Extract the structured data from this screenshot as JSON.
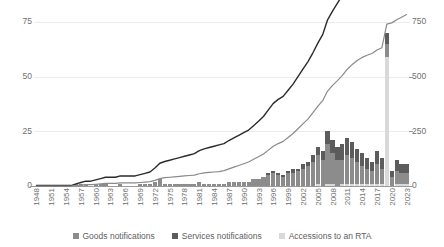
{
  "chart_data": {
    "type": "bar",
    "title": "",
    "subtitle": "",
    "xlabel": "",
    "ylabel": "",
    "y2label": "",
    "grid": true,
    "legend_position": "bottom",
    "ylim": [
      0,
      75
    ],
    "y2lim": [
      0,
      750
    ],
    "yticks": [
      "0",
      "25",
      "50",
      "75"
    ],
    "ytick_values": [
      0,
      25,
      50,
      75
    ],
    "y2ticks": [
      "0",
      "250",
      "500",
      "750"
    ],
    "y2tick_values": [
      0,
      250,
      500,
      750
    ],
    "x": [
      1948,
      1949,
      1950,
      1951,
      1952,
      1953,
      1954,
      1955,
      1956,
      1957,
      1958,
      1959,
      1960,
      1961,
      1962,
      1963,
      1964,
      1965,
      1966,
      1967,
      1968,
      1969,
      1970,
      1971,
      1972,
      1973,
      1974,
      1975,
      1976,
      1977,
      1978,
      1979,
      1980,
      1981,
      1982,
      1983,
      1984,
      1985,
      1986,
      1987,
      1988,
      1989,
      1990,
      1991,
      1992,
      1993,
      1994,
      1995,
      1996,
      1997,
      1998,
      1999,
      2000,
      2001,
      2002,
      2003,
      2004,
      2005,
      2006,
      2007,
      2008,
      2009,
      2010,
      2011,
      2012,
      2013,
      2014,
      2015,
      2016,
      2017,
      2018,
      2019,
      2020,
      2021,
      2022,
      2023
    ],
    "xtick_labels": [
      "1948",
      "1951",
      "1954",
      "1957",
      "1960",
      "1963",
      "1966",
      "1969",
      "1972",
      "1975",
      "1978",
      "1981",
      "1984",
      "1987",
      "1990",
      "1993",
      "1996",
      "1999",
      "2002",
      "2005",
      "2008",
      "2011",
      "2014",
      "2017",
      "2020",
      "2023"
    ],
    "xtick_values": [
      1948,
      1951,
      1954,
      1957,
      1960,
      1963,
      1966,
      1969,
      1972,
      1975,
      1978,
      1981,
      1984,
      1987,
      1990,
      1993,
      1996,
      1999,
      2002,
      2005,
      2008,
      2011,
      2014,
      2017,
      2020,
      2023
    ],
    "stacked": true,
    "series": [
      {
        "name": "Goods notifications",
        "kind": "bar",
        "axis": "left",
        "color": "#8c8c8c",
        "values": [
          0,
          0,
          0,
          0,
          0,
          0,
          0,
          0,
          1,
          1,
          1,
          0,
          1,
          1,
          1,
          0,
          0,
          1,
          0,
          0,
          0,
          1,
          1,
          1,
          2,
          3,
          1,
          1,
          1,
          1,
          1,
          1,
          1,
          2,
          1,
          1,
          1,
          1,
          1,
          2,
          2,
          2,
          2,
          2,
          3,
          3,
          4,
          5,
          6,
          5,
          4,
          6,
          6,
          7,
          8,
          9,
          11,
          13,
          12,
          18,
          14,
          12,
          11,
          13,
          12,
          10,
          8,
          7,
          6,
          9,
          7,
          6,
          4,
          6,
          5,
          5
        ]
      },
      {
        "name": "Services notifications",
        "kind": "bar",
        "axis": "left",
        "color": "#5c5c5c",
        "values": [
          0,
          0,
          0,
          0,
          0,
          0,
          0,
          0,
          0,
          0,
          0,
          0,
          0,
          0,
          0,
          0,
          0,
          0,
          0,
          0,
          0,
          0,
          0,
          0,
          0,
          0,
          0,
          0,
          0,
          0,
          0,
          0,
          0,
          0,
          0,
          0,
          0,
          0,
          0,
          0,
          0,
          0,
          0,
          0,
          0,
          0,
          0,
          1,
          1,
          1,
          1,
          1,
          2,
          1,
          2,
          2,
          3,
          4,
          4,
          6,
          6,
          6,
          7,
          8,
          7,
          6,
          6,
          5,
          4,
          6,
          5,
          5,
          3,
          5,
          4,
          4
        ]
      },
      {
        "name": "Accessions to an RTA",
        "kind": "bar",
        "axis": "left",
        "color": "#d9d9d9",
        "values": [
          0,
          0,
          0,
          0,
          0,
          0,
          0,
          0,
          0,
          0,
          0,
          0,
          0,
          0,
          0,
          0,
          0,
          0,
          0,
          0,
          0,
          0,
          0,
          0,
          0,
          0,
          0,
          0,
          0,
          0,
          0,
          0,
          0,
          0,
          0,
          0,
          0,
          0,
          0,
          0,
          0,
          0,
          0,
          0,
          0,
          0,
          0,
          0,
          0,
          0,
          0,
          0,
          0,
          0,
          0,
          0,
          0,
          1,
          0,
          1,
          1,
          0,
          1,
          1,
          1,
          1,
          1,
          1,
          1,
          1,
          1,
          59,
          0,
          1,
          1,
          1
        ]
      },
      {
        "name": "Cumulative notifications (total)",
        "kind": "line",
        "axis": "right",
        "color": "#2b2b2b",
        "values": [
          2,
          2,
          2,
          2,
          2,
          2,
          2,
          2,
          10,
          16,
          22,
          22,
          28,
          34,
          40,
          40,
          40,
          46,
          46,
          46,
          46,
          52,
          58,
          64,
          82,
          104,
          112,
          118,
          124,
          130,
          136,
          142,
          148,
          162,
          170,
          176,
          182,
          188,
          194,
          208,
          220,
          232,
          244,
          256,
          276,
          296,
          318,
          348,
          378,
          396,
          410,
          438,
          466,
          500,
          534,
          568,
          608,
          652,
          692,
          760,
          800,
          836,
          872,
          916,
          950,
          978,
          1000,
          1016,
          1028,
          1052,
          1068,
          1240,
          1248,
          1272,
          1292,
          1312
        ]
      },
      {
        "name": "Cumulative notifications in force",
        "kind": "line",
        "axis": "right",
        "color": "#8a8a8a",
        "values": [
          0,
          0,
          0,
          0,
          0,
          0,
          0,
          0,
          2,
          4,
          6,
          6,
          8,
          10,
          12,
          12,
          12,
          14,
          14,
          14,
          14,
          16,
          18,
          20,
          26,
          34,
          38,
          40,
          42,
          44,
          46,
          48,
          50,
          56,
          60,
          62,
          64,
          66,
          70,
          78,
          86,
          94,
          102,
          110,
          122,
          134,
          146,
          164,
          182,
          194,
          204,
          222,
          240,
          262,
          284,
          306,
          334,
          364,
          390,
          434,
          460,
          482,
          506,
          534,
          556,
          574,
          588,
          598,
          606,
          622,
          632,
          740,
          746,
          760,
          772,
          784
        ]
      }
    ],
    "legend": [
      {
        "label": "Goods notifications",
        "color": "#8c8c8c"
      },
      {
        "label": "Services notifications",
        "color": "#5c5c5c"
      },
      {
        "label": "Accessions to an RTA",
        "color": "#d9d9d9"
      }
    ]
  }
}
